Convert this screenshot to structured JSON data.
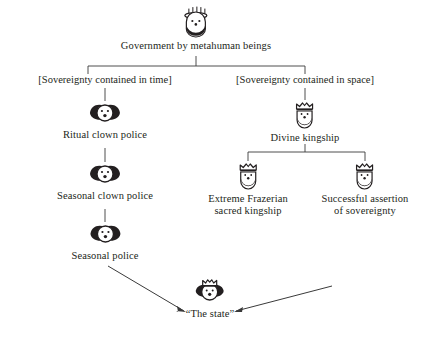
{
  "diagram": {
    "title": "Government by metahuman beings",
    "root": {
      "label": "Government by metahuman beings",
      "icon": "haloed-metahuman-icon"
    },
    "branch_labels": {
      "left": "[Sovereignty contained in time]",
      "right": "[Sovereignty contained in space]"
    },
    "nodes": [
      {
        "id": "ritual-clown-police",
        "label": "Ritual clown police",
        "icon": "clown-face-icon"
      },
      {
        "id": "seasonal-clown-police",
        "label": "Seasonal clown police",
        "icon": "clown-face-icon"
      },
      {
        "id": "seasonal-police",
        "label": "Seasonal police",
        "icon": "clown-face-icon"
      },
      {
        "id": "divine-kingship",
        "label": "Divine kingship",
        "icon": "crowned-king-icon"
      },
      {
        "id": "extreme-frazerian-sacred-kingship",
        "label_line1": "Extreme Frazerian",
        "label_line2": "sacred kingship",
        "icon": "crowned-king-icon"
      },
      {
        "id": "successful-assertion-of-sovereignty",
        "label_line1": "Successful assertion",
        "label_line2": "of sovereignty",
        "icon": "crowned-king-icon"
      },
      {
        "id": "the-state",
        "label": "“The state”",
        "icon": "crowned-clown-state-icon"
      }
    ],
    "colors": {
      "ink": "#231f20",
      "line": "#3a3a3a",
      "background": "#ffffff"
    }
  }
}
